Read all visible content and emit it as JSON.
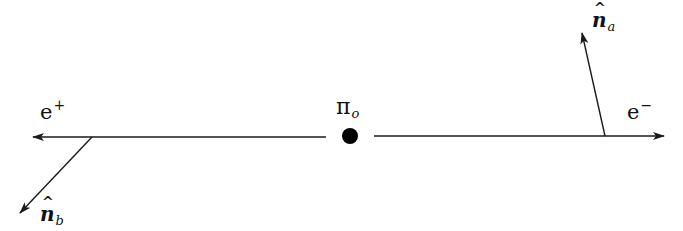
{
  "diagram": {
    "type": "pion decay schematic",
    "center": {
      "label": "π",
      "subscript": "o",
      "marker": "filled-circle"
    },
    "particles": [
      {
        "id": "positron",
        "label": "e",
        "superscript": "+",
        "direction": "left"
      },
      {
        "id": "electron",
        "label": "e",
        "superscript": "−",
        "direction": "right"
      }
    ],
    "vectors": [
      {
        "id": "n_a",
        "label": "n",
        "subscript": "a",
        "attached_to": "electron",
        "direction": "up-left"
      },
      {
        "id": "n_b",
        "label": "n",
        "subscript": "b",
        "attached_to": "positron",
        "direction": "down-left"
      }
    ],
    "colors": {
      "line": "#1a1a1a",
      "dot": "#000000",
      "background": "#ffffff"
    }
  }
}
